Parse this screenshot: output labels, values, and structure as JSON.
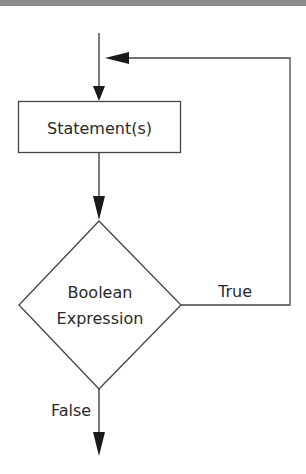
{
  "diagram": {
    "type": "flowchart",
    "title": "",
    "nodes": {
      "statement": {
        "shape": "rectangle",
        "label": "Statement(s)"
      },
      "condition": {
        "shape": "diamond",
        "label_line1": "Boolean",
        "label_line2": "Expression"
      }
    },
    "edges": {
      "entry": {
        "from": "start",
        "to": "statement",
        "label": ""
      },
      "to_condition": {
        "from": "statement",
        "to": "condition",
        "label": ""
      },
      "true_loop": {
        "from": "condition",
        "to": "statement",
        "label": "True"
      },
      "false_exit": {
        "from": "condition",
        "to": "end",
        "label": "False"
      }
    },
    "colors": {
      "stroke": "#333333",
      "text": "#2a2a2a",
      "topbar": "#8c8c8c"
    }
  }
}
